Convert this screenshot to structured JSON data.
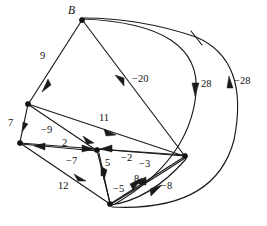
{
  "figure": {
    "type": "directed-weighted-graph",
    "background_color": "#ffffff",
    "stroke_color": "#1a1a1a",
    "width": 267,
    "height": 226
  },
  "nodes": [
    {
      "id": "B",
      "label": "B",
      "x": 82,
      "y": 20,
      "label_x": 70,
      "label_y": 6
    },
    {
      "id": "C",
      "label": "",
      "x": 28,
      "y": 104
    },
    {
      "id": "D",
      "label": "",
      "x": 20,
      "y": 143
    },
    {
      "id": "E",
      "label": "",
      "x": 97,
      "y": 150
    },
    {
      "id": "F",
      "label": "",
      "x": 110,
      "y": 204
    },
    {
      "id": "G",
      "label": "",
      "x": 185,
      "y": 156
    }
  ],
  "edge_labels": [
    {
      "name": "edge-label-9",
      "text": "9",
      "x": 40,
      "y": 51
    },
    {
      "name": "edge-label-7",
      "text": "7",
      "x": 8,
      "y": 118
    },
    {
      "name": "edge-label-neg9",
      "text": "−9",
      "x": 41,
      "y": 125
    },
    {
      "name": "edge-label-11",
      "text": "11",
      "x": 99,
      "y": 113
    },
    {
      "name": "edge-label-2",
      "text": "2",
      "x": 62,
      "y": 138
    },
    {
      "name": "edge-label-neg7",
      "text": "−7",
      "x": 66,
      "y": 156
    },
    {
      "name": "edge-label-12",
      "text": "12",
      "x": 58,
      "y": 181
    },
    {
      "name": "edge-label-5",
      "text": "5",
      "x": 105,
      "y": 158
    },
    {
      "name": "edge-label-neg2",
      "text": "−2",
      "x": 121,
      "y": 153
    },
    {
      "name": "edge-label-neg3",
      "text": "−3",
      "x": 139,
      "y": 159
    },
    {
      "name": "edge-label-8",
      "text": "8",
      "x": 134,
      "y": 174
    },
    {
      "name": "edge-label-neg5",
      "text": "−5",
      "x": 113,
      "y": 184
    },
    {
      "name": "edge-label-neg8",
      "text": "−8",
      "x": 161,
      "y": 181
    },
    {
      "name": "edge-label-neg20",
      "text": "−20",
      "x": 132,
      "y": 74
    },
    {
      "name": "edge-label-28",
      "text": "28",
      "x": 201,
      "y": 79
    },
    {
      "name": "edge-label-neg28",
      "text": "−28",
      "x": 234,
      "y": 76
    }
  ],
  "graph_data": {
    "type": "diagram",
    "title": "",
    "directed": true,
    "weighted": true,
    "node_ids": [
      "B",
      "C",
      "D",
      "E",
      "F",
      "G"
    ],
    "edges": [
      {
        "from": "B",
        "to": "C",
        "weight": 9
      },
      {
        "from": "C",
        "to": "D",
        "weight": 7
      },
      {
        "from": "E",
        "to": "C",
        "weight": -9
      },
      {
        "from": "C",
        "to": "G",
        "weight": 11
      },
      {
        "from": "D",
        "to": "E",
        "weight": 2
      },
      {
        "from": "E",
        "to": "D",
        "weight": -7
      },
      {
        "from": "D",
        "to": "F",
        "weight": 12
      },
      {
        "from": "E",
        "to": "F",
        "weight": 5
      },
      {
        "from": "G",
        "to": "E",
        "weight": -2
      },
      {
        "from": "F",
        "to": "G",
        "weight": -3
      },
      {
        "from": "G",
        "to": "F",
        "weight": 8
      },
      {
        "from": "F",
        "to": "E",
        "weight": -5
      },
      {
        "from": "F",
        "to": "G",
        "weight": -8
      },
      {
        "from": "G",
        "to": "B",
        "weight": -20
      },
      {
        "from": "B",
        "to": "F",
        "weight": 28
      },
      {
        "from": "F",
        "to": "B",
        "weight": -28
      }
    ]
  }
}
